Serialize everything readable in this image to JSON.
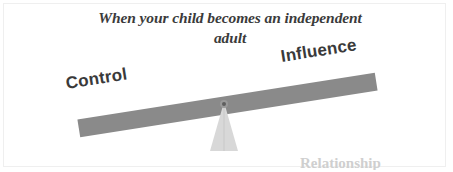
{
  "slide": {
    "background_color": "#ffffff",
    "frame_color": "#efefef",
    "width": 453,
    "height": 172
  },
  "title": {
    "line1": "When your child becomes an independent",
    "line2": "adult",
    "color": "#3b3b3b"
  },
  "diagram": {
    "type": "balance-scale",
    "beam_color": "#8a8a8a",
    "fulcrum_color": "#d8d8d8",
    "pivot_color": "#6f6f6f",
    "tilt_degrees": -8.9,
    "labels": {
      "left": "Control",
      "right": "Influence",
      "label_color": "#3a3a3a"
    },
    "meaning": {
      "lower_side": "Control",
      "higher_side": "Influence"
    }
  },
  "clipped_caption": {
    "text": "Relationship",
    "color": "#cfcfcf"
  }
}
